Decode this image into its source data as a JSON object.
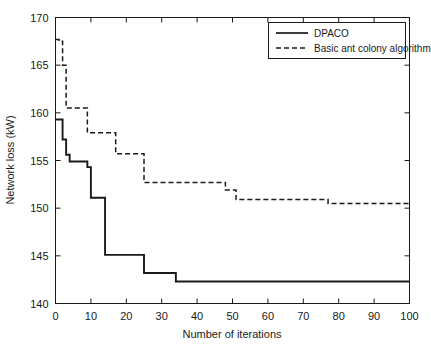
{
  "chart_data": {
    "type": "line",
    "title": "",
    "xlabel": "Number of iterations",
    "ylabel": "Network loss (kW)",
    "xlim": [
      0,
      100
    ],
    "ylim": [
      140,
      170
    ],
    "xticks": [
      0,
      10,
      20,
      30,
      40,
      50,
      60,
      70,
      80,
      90,
      100
    ],
    "yticks": [
      140,
      145,
      150,
      155,
      160,
      165,
      170
    ],
    "grid": false,
    "legend_position": "top-right",
    "series": [
      {
        "name": "DPACO",
        "style": "solid",
        "color": "#1a1a1a",
        "x": [
          0,
          1,
          2,
          3,
          4,
          5,
          6,
          7,
          8,
          9,
          10,
          11,
          12,
          13,
          14,
          15,
          16,
          17,
          18,
          19,
          20,
          21,
          22,
          23,
          24,
          25,
          26,
          27,
          28,
          29,
          30,
          31,
          32,
          33,
          34,
          35,
          40,
          50,
          60,
          70,
          80,
          90,
          100
        ],
        "values": [
          159.3,
          159.3,
          157.2,
          155.6,
          154.9,
          154.9,
          154.9,
          154.9,
          154.9,
          154.3,
          151.1,
          151.1,
          151.1,
          151.1,
          145.1,
          145.1,
          145.1,
          145.1,
          145.1,
          145.1,
          145.1,
          145.1,
          145.1,
          145.1,
          145.1,
          143.2,
          143.2,
          143.2,
          143.2,
          143.2,
          143.2,
          143.2,
          143.2,
          143.2,
          142.3,
          142.3,
          142.3,
          142.3,
          142.3,
          142.3,
          142.3,
          142.3,
          142.3
        ]
      },
      {
        "name": "Basic ant colony algorithm",
        "style": "dashed",
        "color": "#1a1a1a",
        "x": [
          0,
          1,
          2,
          3,
          4,
          5,
          6,
          7,
          8,
          9,
          10,
          12,
          14,
          16,
          17,
          18,
          20,
          22,
          23,
          24,
          25,
          30,
          35,
          40,
          45,
          47,
          48,
          50,
          51,
          55,
          60,
          65,
          70,
          75,
          76,
          77,
          80,
          85,
          90,
          95,
          100
        ],
        "values": [
          167.7,
          167.5,
          165.0,
          160.5,
          160.5,
          160.5,
          160.5,
          160.5,
          160.5,
          157.9,
          157.9,
          157.9,
          157.9,
          157.9,
          155.7,
          155.7,
          155.7,
          155.7,
          155.7,
          155.7,
          152.7,
          152.7,
          152.7,
          152.7,
          152.7,
          152.7,
          151.9,
          151.9,
          150.9,
          150.9,
          150.9,
          150.9,
          150.9,
          150.9,
          150.9,
          150.5,
          150.5,
          150.5,
          150.5,
          150.5,
          150.5
        ]
      }
    ]
  },
  "legend": {
    "items": [
      {
        "label": "DPACO",
        "style": "solid"
      },
      {
        "label": "Basic ant colony algorithm",
        "style": "dashed"
      }
    ]
  },
  "axes": {
    "x_title": "Number of iterations",
    "y_title": "Network loss (kW)",
    "x_tick_labels": [
      "0",
      "10",
      "20",
      "30",
      "40",
      "50",
      "60",
      "70",
      "80",
      "90",
      "100"
    ],
    "y_tick_labels": [
      "140",
      "145",
      "150",
      "155",
      "160",
      "165",
      "170"
    ]
  },
  "colors": {
    "line": "#1a1a1a",
    "axis": "#1a1a1a",
    "background": "#ffffff"
  }
}
